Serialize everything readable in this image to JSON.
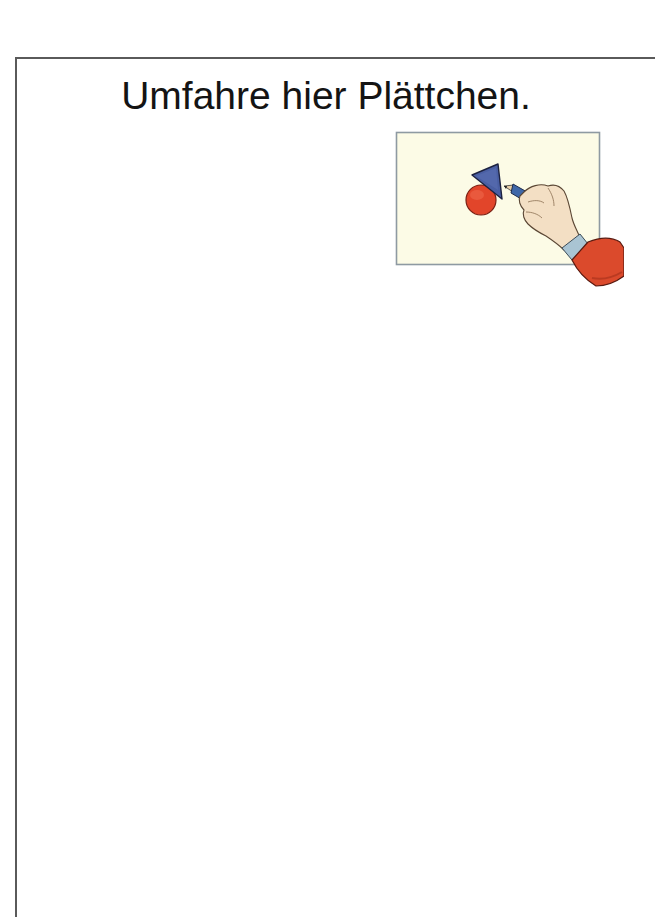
{
  "worksheet": {
    "instruction": "Umfahre hier Plättchen.",
    "illustration": {
      "icon": "hand-tracing-shapes-icon",
      "description": "Hand with blue pencil tracing around a blue triangle and a red circle on a sheet of paper",
      "colors": {
        "paper": "#fcfbe6",
        "paper_border": "#8e9aa2",
        "triangle": "#4a5fa3",
        "circle": "#e2452a",
        "pencil": "#3f67a8",
        "skin": "#f3dfc4",
        "cuff": "#a9c4d3",
        "sleeve": "#db4a2c"
      }
    }
  }
}
